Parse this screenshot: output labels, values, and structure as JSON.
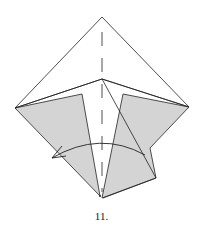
{
  "diagram": {
    "step_label": "11.",
    "colors": {
      "line": "#222222",
      "paper_gray": "#d4d4d4",
      "paper_white": "#ffffff"
    },
    "symbols": [
      "valley-fold-line",
      "fold-arrow"
    ]
  }
}
